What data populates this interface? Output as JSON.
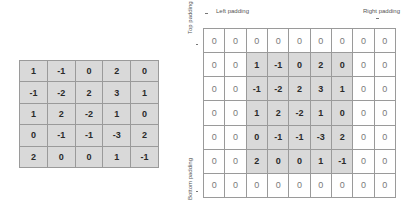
{
  "input_matrix": {
    "rows": [
      [
        "1",
        "-1",
        "0",
        "2",
        "0"
      ],
      [
        "-1",
        "-2",
        "2",
        "3",
        "1"
      ],
      [
        "1",
        "2",
        "-2",
        "1",
        "0"
      ],
      [
        "0",
        "-1",
        "-1",
        "-3",
        "2"
      ],
      [
        "2",
        "0",
        "0",
        "1",
        "-1"
      ]
    ]
  },
  "padded_matrix": {
    "padding": {
      "top": 1,
      "bottom": 1,
      "left": 2,
      "right": 2
    },
    "rows": [
      [
        "0",
        "0",
        "0",
        "0",
        "0",
        "0",
        "0",
        "0",
        "0"
      ],
      [
        "0",
        "0",
        "1",
        "-1",
        "0",
        "2",
        "0",
        "0",
        "0"
      ],
      [
        "0",
        "0",
        "-1",
        "-2",
        "2",
        "3",
        "1",
        "0",
        "0"
      ],
      [
        "0",
        "0",
        "1",
        "2",
        "-2",
        "1",
        "0",
        "0",
        "0"
      ],
      [
        "0",
        "0",
        "0",
        "-1",
        "-1",
        "-3",
        "2",
        "0",
        "0"
      ],
      [
        "0",
        "0",
        "2",
        "0",
        "0",
        "1",
        "-1",
        "0",
        "0"
      ],
      [
        "0",
        "0",
        "0",
        "0",
        "0",
        "0",
        "0",
        "0",
        "0"
      ]
    ]
  },
  "labels": {
    "left_padding": "Left padding",
    "right_padding": "Right padding",
    "top_padding": "Top padding",
    "bottom_padding": "Bottom padding"
  },
  "colors": {
    "data_cell_bg": "#d9d9d9",
    "padding_cell_bg": "#ffffff",
    "grid_line": "#9a9a9a"
  }
}
